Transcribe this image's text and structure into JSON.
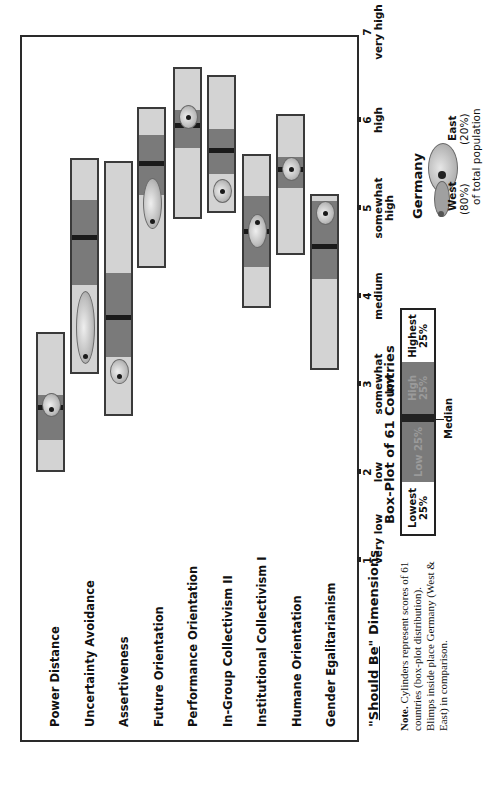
{
  "chart_data": {
    "type": "box",
    "title": "\"Should Be\" Dimensions",
    "xlabel": "\"Should Be\" Dimensions",
    "ylabel": "",
    "orientation": "rotated-90-ccw",
    "ylim": [
      1,
      7
    ],
    "ticks": [
      {
        "value": 1,
        "label": "very low"
      },
      {
        "value": 2,
        "label": "low"
      },
      {
        "value": 3,
        "label": "somewhat low"
      },
      {
        "value": 4,
        "label": "medium"
      },
      {
        "value": 5,
        "label": "somewhat high"
      },
      {
        "value": 6,
        "label": "high"
      },
      {
        "value": 7,
        "label": "very high"
      }
    ],
    "categories": [
      "Power Distance",
      "Uncertainty Avoidance",
      "Assertiveness",
      "Future Orientation",
      "Performance Orientation",
      "In-Group Collectivism II",
      "Institutional Collectivism I",
      "Humane Orientation",
      "Gender Egalitarianism"
    ],
    "series": [
      {
        "name": "Power Distance",
        "min": 2.0,
        "q1": 2.36,
        "median": 2.73,
        "q3": 2.87,
        "max": 3.59,
        "germany_west": 2.7,
        "germany_east": 2.8
      },
      {
        "name": "Uncertainty Avoidance",
        "min": 3.11,
        "q1": 4.13,
        "median": 4.66,
        "q3": 5.09,
        "max": 5.57,
        "germany_west": 3.31,
        "germany_east": 3.95
      },
      {
        "name": "Assertiveness",
        "min": 2.64,
        "q1": 3.31,
        "median": 3.75,
        "q3": 4.26,
        "max": 5.53,
        "germany_west": 3.08,
        "germany_east": 3.18
      },
      {
        "name": "Future Orientation",
        "min": 4.32,
        "q1": 5.15,
        "median": 5.5,
        "q3": 5.83,
        "max": 6.15,
        "germany_west": 4.84,
        "germany_east": 5.24
      },
      {
        "name": "Performance Orientation",
        "min": 4.88,
        "q1": 5.68,
        "median": 5.93,
        "q3": 6.11,
        "max": 6.6,
        "germany_west": 6.02,
        "germany_east": 6.02
      },
      {
        "name": "In-Group Collectivism II",
        "min": 4.94,
        "q1": 5.39,
        "median": 5.65,
        "q3": 5.9,
        "max": 6.51,
        "germany_west": 5.18,
        "germany_east": 5.18
      },
      {
        "name": "Institutional Collectivism I",
        "min": 3.86,
        "q1": 4.33,
        "median": 4.73,
        "q3": 5.14,
        "max": 5.61,
        "germany_west": 4.83,
        "germany_east": 4.63
      },
      {
        "name": "Humane Orientation",
        "min": 4.47,
        "q1": 5.23,
        "median": 5.43,
        "q3": 5.58,
        "max": 6.07,
        "germany_west": 5.43,
        "germany_east": 5.43
      },
      {
        "name": "Gender Egalitarianism",
        "min": 3.16,
        "q1": 4.19,
        "median": 4.56,
        "q3": 5.08,
        "max": 5.16,
        "germany_west": 4.93,
        "germany_east": 4.93
      }
    ],
    "legend": {
      "boxplot_title": "Box-Plot of 61 Countries",
      "segments": [
        "Lowest 25%",
        "Low 25%",
        "High 25%",
        "Highest 25%"
      ],
      "median_label": "Median",
      "germany_title": "Germany",
      "germany_west": "West (80%)",
      "germany_east": "East (20%)",
      "germany_caption": "of total population"
    },
    "note": "Note. Cylinders represent scores of 61 countries (box-plot distribution). Blimps inside place Germany (West & East) in comparison."
  },
  "axis": {
    "title_prefix": "\"",
    "title_underlined": "Should Be",
    "title_suffix": "\" Dimensions",
    "tick_labels": [
      {
        "num": "1",
        "text": "very low"
      },
      {
        "num": "2",
        "text": "low"
      },
      {
        "num": "3",
        "text": "somewhat low"
      },
      {
        "num": "4",
        "text": "medium"
      },
      {
        "num": "5",
        "text": "somewhat high"
      },
      {
        "num": "6",
        "text": "high"
      },
      {
        "num": "7",
        "text": "very high"
      }
    ]
  },
  "legend": {
    "boxplot_title": "Box-Plot of 61 Countries",
    "lowest": "Lowest 25%",
    "low": "Low 25%",
    "high": "High 25%",
    "highest": "Highest 25%",
    "median": "Median",
    "germany_title": "Germany",
    "west": "West",
    "west_pct": "(80%)",
    "east": "East",
    "east_pct": "(20%)",
    "caption": "of total population"
  },
  "note": {
    "lead": "Note.",
    "text": " Cylinders represent scores of 61 countries (box-plot distribution). Blimps inside place Germany (West & East) in comparison."
  },
  "colors": {
    "light": "#d3d3d3",
    "dark": "#7a7a7a",
    "median": "#1a1a1a",
    "frame": "#2a2a2a"
  }
}
